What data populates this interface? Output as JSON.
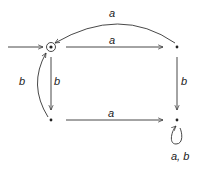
{
  "diagram": {
    "type": "finite-automaton",
    "states": [
      {
        "id": "q0",
        "x": 51,
        "y": 47,
        "initial": true,
        "accepting": true
      },
      {
        "id": "q1",
        "x": 177,
        "y": 47
      },
      {
        "id": "q2",
        "x": 51,
        "y": 120
      },
      {
        "id": "q3",
        "x": 177,
        "y": 120
      }
    ],
    "edges": [
      {
        "from": "q0",
        "to": "q1",
        "label": "a"
      },
      {
        "from": "q1",
        "to": "q0",
        "label": "a",
        "curved": true
      },
      {
        "from": "q0",
        "to": "q2",
        "label": "b"
      },
      {
        "from": "q2",
        "to": "q0",
        "label": "b",
        "curved": true
      },
      {
        "from": "q2",
        "to": "q3",
        "label": "a"
      },
      {
        "from": "q1",
        "to": "q3",
        "label": "b"
      },
      {
        "from": "q3",
        "to": "q3",
        "label": "a, b",
        "loop": true
      }
    ],
    "labels": {
      "top_arc": "a",
      "top_straight": "a",
      "left_curve": "b",
      "left_straight": "b",
      "right_straight": "b",
      "bottom_straight": "a",
      "loop": "a, b"
    }
  }
}
